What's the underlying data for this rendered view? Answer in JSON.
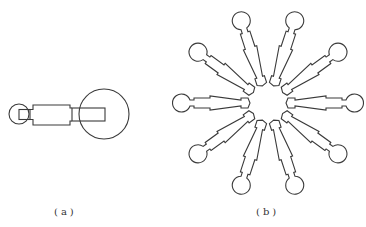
{
  "figures": [
    {
      "id": "a",
      "caption": "(a)",
      "description": "single arm with small circle end and large circle end"
    },
    {
      "id": "b",
      "caption": "(b)",
      "description": "ten arms arranged radially around a center",
      "arm_count": 10
    }
  ],
  "colors": {
    "stroke": "#3a3a3a",
    "background": "#ffffff"
  }
}
